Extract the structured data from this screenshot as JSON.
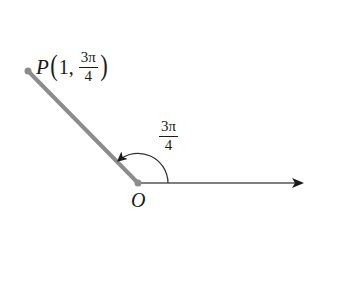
{
  "figure": {
    "type": "polar-coordinate-diagram",
    "point": {
      "name": "P",
      "r": "1",
      "theta_numerator": "3π",
      "theta_denominator": "4",
      "open_paren": "(",
      "close_paren": ")",
      "separator": ","
    },
    "angle": {
      "numerator": "3π",
      "denominator": "4"
    },
    "origin": {
      "label": "O"
    },
    "colors": {
      "terminal_ray": "#8c8c8c",
      "polar_axis": "#555555",
      "arc": "#333333",
      "point_dot": "#8c8c8c",
      "text": "#1a1a1a"
    }
  }
}
